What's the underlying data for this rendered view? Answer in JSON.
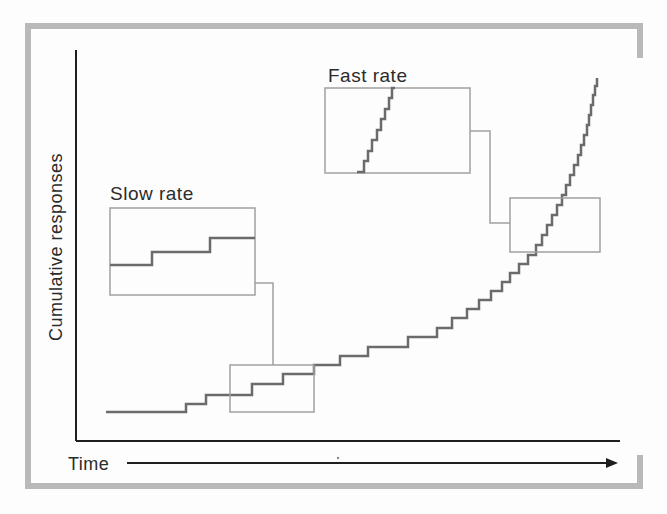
{
  "figure": {
    "description_visible_text_only": "",
    "y_axis_label": "Cumulative responses",
    "x_axis_label": "Time"
  },
  "colors": {
    "outer_frame": "#b9b9b9",
    "axes": "#1f1f1f",
    "curve": "#6b6b6b",
    "zoom_boxes_and_connectors": "#a0a0a0",
    "text": "#2b2b2b",
    "background": "#fdfdfd"
  },
  "chart_data": {
    "type": "line",
    "subtype": "cumulative-record-step-function",
    "title": "",
    "xlabel": "Time",
    "ylabel": "Cumulative responses",
    "grid": false,
    "x_axis": {
      "ticks": [],
      "arrow": true,
      "axis_px_span": [
        76,
        620
      ]
    },
    "y_axis": {
      "ticks": [],
      "axis_px_span": [
        441,
        50
      ]
    },
    "series": [
      {
        "name": "cumulative-responses",
        "color": "#6b6b6b",
        "points_px": [
          [
            106,
            412
          ],
          [
            186,
            412
          ],
          [
            186,
            404
          ],
          [
            206,
            404
          ],
          [
            206,
            395
          ],
          [
            252,
            395
          ],
          [
            252,
            384
          ],
          [
            283,
            384
          ],
          [
            283,
            374
          ],
          [
            314,
            374
          ],
          [
            314,
            365
          ],
          [
            340,
            365
          ],
          [
            340,
            356
          ],
          [
            368,
            356
          ],
          [
            368,
            347
          ],
          [
            408,
            347
          ],
          [
            408,
            337
          ],
          [
            437,
            337
          ],
          [
            437,
            328
          ],
          [
            452,
            328
          ],
          [
            452,
            318
          ],
          [
            467,
            318
          ],
          [
            467,
            309
          ],
          [
            479,
            309
          ],
          [
            479,
            300
          ],
          [
            491,
            300
          ],
          [
            491,
            291
          ],
          [
            502,
            291
          ],
          [
            502,
            282
          ],
          [
            510,
            282
          ],
          [
            510,
            273
          ],
          [
            519,
            273
          ],
          [
            519,
            264
          ],
          [
            528,
            264
          ],
          [
            528,
            255
          ],
          [
            536,
            255
          ],
          [
            536,
            245
          ],
          [
            542,
            245
          ],
          [
            542,
            235
          ],
          [
            547,
            235
          ],
          [
            547,
            225
          ],
          [
            552,
            225
          ],
          [
            552,
            215
          ],
          [
            557,
            215
          ],
          [
            557,
            205
          ],
          [
            562,
            205
          ],
          [
            562,
            195
          ],
          [
            566,
            195
          ],
          [
            566,
            185
          ],
          [
            570,
            185
          ],
          [
            570,
            175
          ],
          [
            574,
            175
          ],
          [
            574,
            165
          ],
          [
            578,
            165
          ],
          [
            578,
            155
          ],
          [
            581,
            155
          ],
          [
            581,
            145
          ],
          [
            584,
            145
          ],
          [
            584,
            135
          ],
          [
            587,
            135
          ],
          [
            587,
            125
          ],
          [
            589,
            125
          ],
          [
            589,
            115
          ],
          [
            591,
            115
          ],
          [
            591,
            105
          ],
          [
            593,
            105
          ],
          [
            593,
            95
          ],
          [
            595,
            95
          ],
          [
            595,
            86
          ],
          [
            597,
            86
          ],
          [
            597,
            78
          ]
        ]
      }
    ],
    "insets": [
      {
        "name": "slow-rate-zoom",
        "label": "Slow rate",
        "box_px": [
          110,
          208,
          145,
          87
        ],
        "target_box_px": [
          230,
          365,
          84,
          47
        ],
        "connector_path_px": [
          [
            255,
            283
          ],
          [
            273,
            283
          ],
          [
            273,
            365
          ]
        ],
        "points_px": [
          [
            110,
            265
          ],
          [
            152,
            265
          ],
          [
            152,
            252
          ],
          [
            210,
            252
          ],
          [
            210,
            238
          ],
          [
            255,
            238
          ]
        ]
      },
      {
        "name": "fast-rate-zoom",
        "label": "Fast rate",
        "box_px": [
          325,
          88,
          145,
          85
        ],
        "target_box_px": [
          510,
          198,
          90,
          54
        ],
        "connector_path_px": [
          [
            470,
            131
          ],
          [
            490,
            131
          ],
          [
            490,
            223
          ],
          [
            510,
            223
          ]
        ],
        "points_px": [
          [
            357,
            172
          ],
          [
            364,
            172
          ],
          [
            364,
            161
          ],
          [
            368,
            161
          ],
          [
            368,
            151
          ],
          [
            372,
            151
          ],
          [
            372,
            140
          ],
          [
            377,
            140
          ],
          [
            377,
            130
          ],
          [
            381,
            130
          ],
          [
            381,
            119
          ],
          [
            385,
            119
          ],
          [
            385,
            109
          ],
          [
            389,
            109
          ],
          [
            389,
            98
          ],
          [
            392,
            98
          ],
          [
            392,
            88
          ],
          [
            395,
            88
          ]
        ]
      }
    ]
  }
}
